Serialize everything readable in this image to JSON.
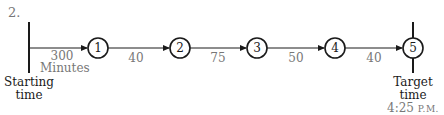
{
  "problem_number": "2.",
  "start": {
    "label_line1": "Starting",
    "label_line2": "time"
  },
  "target": {
    "label_line1": "Target",
    "label_line2": "time",
    "clock": "4:25",
    "meridiem": "P.M."
  },
  "nodes": [
    {
      "id": "1",
      "label": "1"
    },
    {
      "id": "2",
      "label": "2"
    },
    {
      "id": "3",
      "label": "3"
    },
    {
      "id": "4",
      "label": "4"
    },
    {
      "id": "5",
      "label": "5"
    }
  ],
  "edges": [
    {
      "from": "start",
      "to": "1",
      "duration": "300",
      "unit": "Minutes"
    },
    {
      "from": "1",
      "to": "2",
      "duration": "40"
    },
    {
      "from": "2",
      "to": "3",
      "duration": "75"
    },
    {
      "from": "3",
      "to": "4",
      "duration": "50"
    },
    {
      "from": "4",
      "to": "5",
      "duration": "40"
    }
  ],
  "colors": {
    "line": "#1a1a1a",
    "label_gray": "#777777"
  }
}
